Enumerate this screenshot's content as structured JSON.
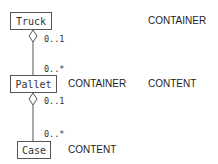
{
  "diagram": {
    "type": "uml-aggregation",
    "classes": [
      {
        "name": "Truck"
      },
      {
        "name": "Pallet"
      },
      {
        "name": "Case"
      }
    ],
    "associations": [
      {
        "whole": "Truck",
        "part": "Pallet",
        "whole_mult": "0..1",
        "part_mult": "0..*"
      },
      {
        "whole": "Pallet",
        "part": "Case",
        "whole_mult": "0..1",
        "part_mult": "0..*"
      }
    ],
    "roles": {
      "truck_role": "CONTAINER",
      "pallet_role_container": "CONTAINER",
      "pallet_role_content": "CONTENT",
      "case_role": "CONTENT"
    }
  }
}
